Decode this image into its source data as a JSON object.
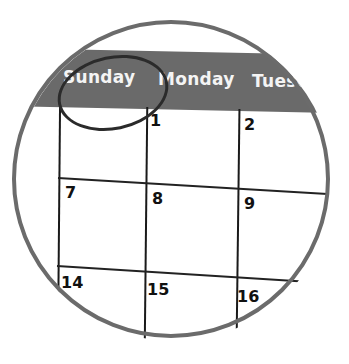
{
  "calendar": {
    "days": [
      "Sunday",
      "Monday",
      "Tuesday"
    ],
    "days_visible": [
      "Sunday",
      "Monday",
      "Tuesc"
    ],
    "highlighted_day": "Sunday",
    "dates": {
      "row1": [
        "",
        "1",
        "2"
      ],
      "row2": [
        "7",
        "8",
        "9"
      ],
      "row3": [
        "14",
        "15",
        "16"
      ]
    }
  },
  "colors": {
    "header_bar": "#6a6a6a",
    "ring": "#6b6b6b",
    "grid": "#1a1a1a",
    "text_header": "#f4f4f4"
  }
}
